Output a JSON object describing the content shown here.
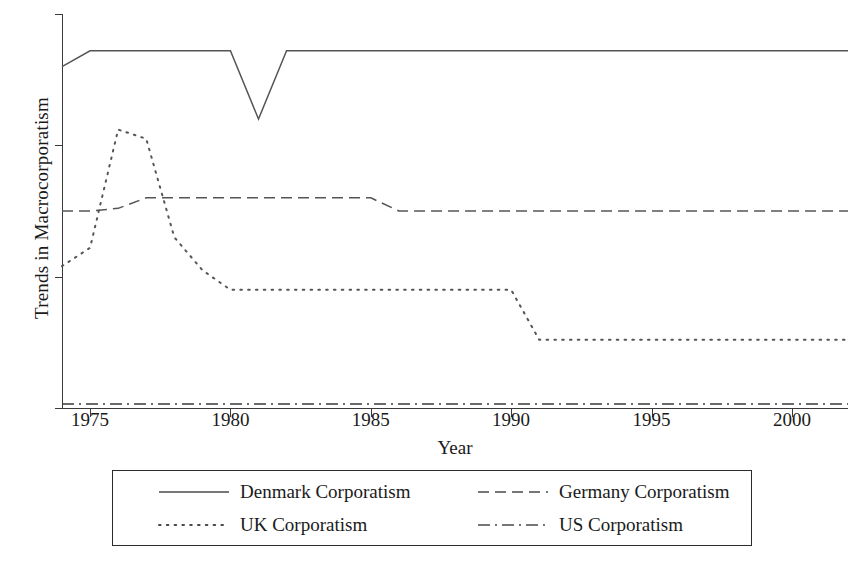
{
  "chart_data": {
    "type": "line",
    "title": "",
    "xlabel": "Year",
    "ylabel": "Trends in Macrocorporatism",
    "xlim": [
      1974,
      2002
    ],
    "ylim": [
      0,
      3
    ],
    "xticks": [
      1975,
      1980,
      1985,
      1990,
      1995,
      2000
    ],
    "xticklabels": [
      "1975",
      "1980",
      "1985",
      "1990",
      "1995",
      "2000"
    ],
    "yticks": [
      0,
      1,
      2,
      3
    ],
    "yticklabels": [
      "0",
      "1",
      "2",
      "3"
    ],
    "grid": false,
    "legend_position": "below-axes",
    "x": [
      1974,
      1975,
      1976,
      1977,
      1978,
      1979,
      1980,
      1981,
      1982,
      1983,
      1984,
      1985,
      1986,
      1987,
      1988,
      1989,
      1990,
      1991,
      1992,
      1993,
      1994,
      1995,
      1996,
      1997,
      1998,
      1999,
      2000,
      2001,
      2002
    ],
    "series": [
      {
        "name": "Denmark Corporatism",
        "linestyle": "solid",
        "color": "#555555",
        "values": [
          2.6,
          2.72,
          2.72,
          2.72,
          2.72,
          2.72,
          2.72,
          2.2,
          2.72,
          2.72,
          2.72,
          2.72,
          2.72,
          2.72,
          2.72,
          2.72,
          2.72,
          2.72,
          2.72,
          2.72,
          2.72,
          2.72,
          2.72,
          2.72,
          2.72,
          2.72,
          2.72,
          2.72,
          2.72
        ]
      },
      {
        "name": "Germany Corporatism",
        "linestyle": "dashed",
        "color": "#555555",
        "values": [
          1.5,
          1.5,
          1.52,
          1.6,
          1.6,
          1.6,
          1.6,
          1.6,
          1.6,
          1.6,
          1.6,
          1.6,
          1.5,
          1.5,
          1.5,
          1.5,
          1.5,
          1.5,
          1.5,
          1.5,
          1.5,
          1.5,
          1.5,
          1.5,
          1.5,
          1.5,
          1.5,
          1.5,
          1.5
        ]
      },
      {
        "name": "UK Corporatism",
        "linestyle": "dotted",
        "color": "#555555",
        "values": [
          1.08,
          1.22,
          2.12,
          2.05,
          1.3,
          1.05,
          0.9,
          0.9,
          0.9,
          0.9,
          0.9,
          0.9,
          0.9,
          0.9,
          0.9,
          0.9,
          0.9,
          0.52,
          0.52,
          0.52,
          0.52,
          0.52,
          0.52,
          0.52,
          0.52,
          0.52,
          0.52,
          0.52,
          0.52
        ]
      },
      {
        "name": "US Corporatism",
        "linestyle": "dashdot",
        "color": "#3a3a3a",
        "values": [
          0.03,
          0.03,
          0.03,
          0.03,
          0.03,
          0.03,
          0.03,
          0.03,
          0.03,
          0.03,
          0.03,
          0.03,
          0.03,
          0.03,
          0.03,
          0.03,
          0.03,
          0.03,
          0.03,
          0.03,
          0.03,
          0.03,
          0.03,
          0.03,
          0.03,
          0.03,
          0.03,
          0.03,
          0.03
        ]
      }
    ]
  },
  "legend": {
    "entries": [
      {
        "label": "Denmark Corporatism",
        "style": "solid"
      },
      {
        "label": "Germany Corporatism",
        "style": "dashed"
      },
      {
        "label": "UK Corporatism",
        "style": "dotted"
      },
      {
        "label": "US Corporatism",
        "style": "dashdot"
      }
    ]
  }
}
